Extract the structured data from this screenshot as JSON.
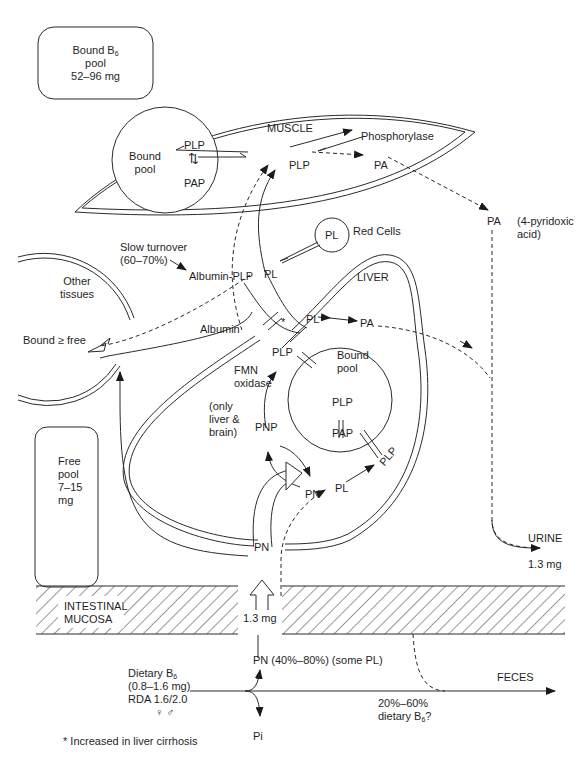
{
  "diagram": {
    "boxes": {
      "bound_pool": {
        "line1": "Bound B",
        "sub": "6",
        "line2": "pool",
        "line3": "52–96 mg"
      },
      "free_pool": {
        "line1": "Free",
        "line2": "pool",
        "line3": "7–15",
        "line4": "mg"
      }
    },
    "compartments": {
      "muscle": "MUSCLE",
      "liver": "LIVER",
      "red_cells": "Red Cells",
      "other_tissues_line1": "Other",
      "other_tissues_line2": "tissues",
      "intestinal_line1": "INTESTINAL",
      "intestinal_line2": "MUCOSA"
    },
    "muscle": {
      "bound_pool_line1": "Bound",
      "bound_pool_line2": "pool",
      "plp": "PLP",
      "pap": "PAP",
      "plp_center": "PLP",
      "phosphorylase": "Phosphorylase",
      "pa": "PA"
    },
    "blood": {
      "pa": "PA",
      "pa_note_line1": "(4-pyridoxic",
      "pa_note_line2": "acid)",
      "slow_turnover_line1": "Slow turnover",
      "slow_turnover_line2": "(60–70%)",
      "albumin_plp": "Albumin-PLP",
      "albumin": "Albumin",
      "bound_free": "Bound ≥ free",
      "red_cell_pl": "PL",
      "pl": "PL",
      "asterisk": "*"
    },
    "liver": {
      "pl": "PL",
      "pa": "PA",
      "plp": "PLP",
      "fmn_line1": "FMN",
      "fmn_line2": "oxidase",
      "only_line1": "(only",
      "only_line2": "liver &",
      "only_line3": "brain)",
      "pnp": "PNP",
      "pn": "PN",
      "pl2": "PL",
      "plp2": "PLP",
      "bound_pool_line1": "Bound",
      "bound_pool_line2": "pool",
      "inner_plp": "PLP",
      "inner_pap": "PAP"
    },
    "absorption": {
      "pn_top": "PN",
      "amount": "1.3 mg",
      "pn_dietary": "PN (40%–80%) (some PL)",
      "pi": "Pi"
    },
    "dietary": {
      "line1": "Dietary B",
      "sub": "6",
      "line2": "(0.8–1.6 mg)",
      "line3": "RDA 1.6/2.0",
      "symbols": "♀ ♂"
    },
    "excretion": {
      "urine": "URINE",
      "urine_amount": "1.3 mg",
      "feces": "FECES",
      "feces_pct": "20%–60%",
      "feces_note": "dietary B",
      "feces_sub": "6",
      "feces_q": "?"
    },
    "footnote": "* Increased in liver cirrhosis"
  }
}
